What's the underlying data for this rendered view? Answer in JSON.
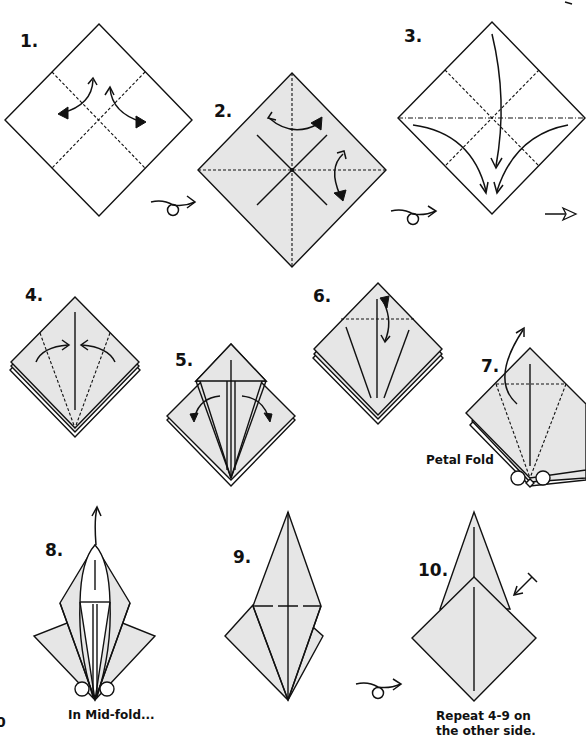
{
  "colors": {
    "paper_fill": "#e6e6e6",
    "line": "#111111",
    "background": "#ffffff"
  },
  "steps": [
    {
      "number": "1.",
      "caption": "",
      "description": "Square (white side up) with diagonal valley-fold creases; fold and unfold arrows"
    },
    {
      "number": "2.",
      "caption": "",
      "description": "Turn over; colored side with book-fold creases, fold and unfold arrows"
    },
    {
      "number": "3.",
      "caption": "",
      "description": "Collapse into square base (preliminary fold)"
    },
    {
      "number": "4.",
      "caption": "",
      "description": "Fold edges to center line"
    },
    {
      "number": "5.",
      "caption": "",
      "description": "Unfold flaps"
    },
    {
      "number": "6.",
      "caption": "",
      "description": "Fold top down and unfold"
    },
    {
      "number": "7.",
      "caption": "Petal Fold",
      "description": "Lift bottom layer up along creases"
    },
    {
      "number": "8.",
      "caption": "In Mid-fold...",
      "description": "Petal fold in progress"
    },
    {
      "number": "9.",
      "caption": "",
      "description": "Completed petal fold, turn over"
    },
    {
      "number": "10.",
      "caption": "Repeat 4-9 on the other side.",
      "description": "Result: bird base"
    }
  ],
  "captions": {
    "petal_fold": "Petal Fold",
    "mid_fold": "In Mid-fold...",
    "repeat_line1": "Repeat 4-9 on",
    "repeat_line2": "the other side."
  },
  "symbols": {
    "turn_over": "turn-over-icon",
    "next_step": "hollow-arrow-icon",
    "fold_unfold": "fold-unfold-arrow-icon",
    "repeat_behind": "repeat-behind-arrow-icon"
  },
  "page_edge_fragment": "0"
}
